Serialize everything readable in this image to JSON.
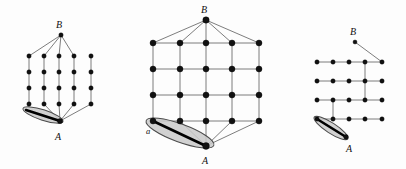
{
  "figure": {
    "kind": "graph-lattice-diagram-set",
    "background_color": "#fdfdfd",
    "node_color": "#111111",
    "edge_color": "#6e6e6e",
    "highlight_fill": "#c9c9c9",
    "highlight_stroke": "#4a4a4a",
    "highlight_bar_color": "#000000",
    "panel_count": 3
  },
  "panels": [
    {
      "id": "panel-left",
      "name": "left-diagram",
      "description": "vertical-only lattice with apex B and sink A",
      "labels": {
        "top": "B",
        "bottom": "A"
      },
      "label_positions": {
        "top": {
          "x": 59,
          "y": 28
        },
        "bottom": {
          "x": 58,
          "y": 140
        }
      },
      "apex": {
        "x": 61,
        "y": 35
      },
      "sink": {
        "x": 60,
        "y": 121
      },
      "grid": {
        "columns": 5,
        "rows": 4,
        "x_positions": [
          29,
          44,
          59,
          74,
          91
        ],
        "y_positions": [
          56,
          72,
          88,
          104
        ]
      },
      "apex_connects_columns": [
        0,
        1,
        2,
        3
      ],
      "sink_connects_columns": [
        0,
        1,
        2,
        3,
        4
      ],
      "vertical_edges": "all columns rows 0-3",
      "highlight_ellipse": {
        "cx": 43,
        "cy": 115,
        "rx": 21,
        "ry": 5.2,
        "rotation_deg": 18,
        "bar_from": {
          "x": 26,
          "y": 110
        },
        "bar_to": {
          "x": 60,
          "y": 121
        }
      }
    },
    {
      "id": "panel-middle",
      "name": "middle-diagram",
      "description": "full grid lattice with apex B and sink A and marked node a",
      "labels": {
        "top": "B",
        "bottom": "A",
        "left_node": "a"
      },
      "label_positions": {
        "top": {
          "x": 204,
          "y": 13
        },
        "bottom": {
          "x": 205,
          "y": 164
        },
        "left_node": {
          "x": 148,
          "y": 134
        }
      },
      "apex": {
        "x": 206,
        "y": 20
      },
      "sink": {
        "x": 206,
        "y": 146
      },
      "grid": {
        "columns": 5,
        "rows": 4,
        "x_positions": [
          153,
          180,
          206,
          232,
          259
        ],
        "y_positions": [
          43,
          69,
          95,
          121
        ]
      },
      "apex_connects_columns": [
        0,
        1,
        2,
        3,
        4
      ],
      "sink_connects_columns": [
        0,
        1,
        2,
        3,
        4
      ],
      "horizontal_edges": "all rows",
      "vertical_edges": "all columns",
      "highlight_ellipse": {
        "cx": 180,
        "cy": 133,
        "rx": 36,
        "ry": 9,
        "rotation_deg": 20,
        "bar_from": {
          "x": 153,
          "y": 121
        },
        "bar_to": {
          "x": 206,
          "y": 146
        }
      }
    },
    {
      "id": "panel-right",
      "name": "right-diagram",
      "description": "horizontal-row lattice with pendant B and sink A",
      "labels": {
        "top": "B",
        "bottom": "A"
      },
      "label_positions": {
        "top": {
          "x": 353,
          "y": 35
        },
        "bottom": {
          "x": 349,
          "y": 152
        }
      },
      "apex": {
        "x": 355,
        "y": 42
      },
      "sink": {
        "x": 348,
        "y": 138
      },
      "grid": {
        "columns": 5,
        "rows": 4,
        "x_positions": [
          317,
          333,
          349,
          365,
          382
        ],
        "y_positions": [
          62,
          81,
          100,
          119
        ]
      },
      "apex_connects_columns": [
        4
      ],
      "horizontal_edges": "all rows",
      "vertical_edges_columns": [
        {
          "column": 3,
          "from_row": 0,
          "to_row": 2
        },
        {
          "column": 1,
          "from_row": 2,
          "to_row": 3
        }
      ],
      "highlight_ellipse": {
        "cx": 329,
        "cy": 128,
        "rx": 20,
        "ry": 5.2,
        "rotation_deg": 42,
        "bar_from": {
          "x": 317,
          "y": 119
        },
        "bar_to": {
          "x": 348,
          "y": 138
        }
      }
    }
  ]
}
